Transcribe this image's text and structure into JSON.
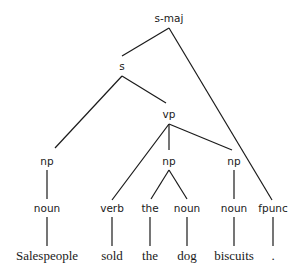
{
  "diagram": {
    "type": "parse-tree",
    "sentence": "Salespeople sold the dog biscuits .",
    "nodes": {
      "s_maj": "s-maj",
      "s": "s",
      "vp": "vp",
      "np1": "np",
      "np2": "np",
      "np3": "np",
      "noun1": "noun",
      "verb": "verb",
      "the_cat": "the",
      "noun2": "noun",
      "noun3": "noun",
      "fpunc": "fpunc"
    },
    "words": {
      "w1": "Salespeople",
      "w2": "sold",
      "w3": "the",
      "w4": "dog",
      "w5": "biscuits",
      "w6": "."
    },
    "edges": [
      [
        "s-maj",
        "s"
      ],
      [
        "s-maj",
        "fpunc"
      ],
      [
        "s",
        "np"
      ],
      [
        "s",
        "vp"
      ],
      [
        "vp",
        "verb"
      ],
      [
        "vp",
        "np"
      ],
      [
        "vp",
        "np"
      ],
      [
        "np",
        "noun"
      ],
      [
        "np",
        "the"
      ],
      [
        "np",
        "noun"
      ],
      [
        "np",
        "noun"
      ],
      [
        "noun",
        "Salespeople"
      ],
      [
        "verb",
        "sold"
      ],
      [
        "the",
        "the"
      ],
      [
        "noun",
        "dog"
      ],
      [
        "noun",
        "biscuits"
      ],
      [
        "fpunc",
        "."
      ]
    ]
  }
}
